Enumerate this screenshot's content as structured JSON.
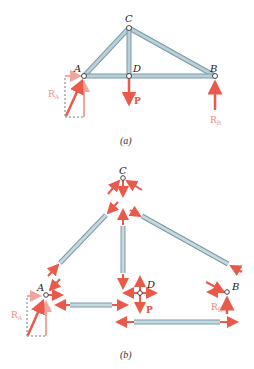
{
  "figure": {
    "part_a": {
      "caption": "(a)",
      "nodes": {
        "A": "A",
        "B": "B",
        "C": "C",
        "D": "D"
      },
      "forces": {
        "RA": "R",
        "RA_sub": "A",
        "P": "P",
        "RB": "R",
        "RB_sub": "B"
      }
    },
    "part_b": {
      "caption": "(b)",
      "nodes": {
        "A": "A",
        "B": "B",
        "C": "C",
        "D": "D"
      },
      "forces": {
        "RA": "R",
        "RA_sub": "A",
        "P": "P",
        "RB": "R",
        "RB_sub": "B"
      }
    },
    "colors": {
      "member": "#a9c4cf",
      "member_edge": "#7c9aa6",
      "force": "#ea5a4b",
      "force_light": "#f2a59d",
      "dashed": "#555555"
    }
  }
}
